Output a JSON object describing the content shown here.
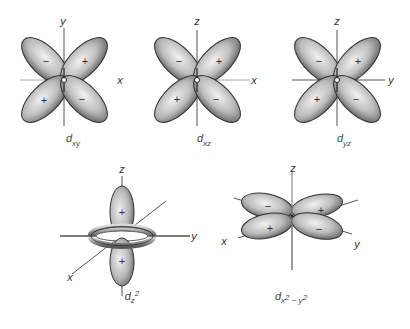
{
  "figure": {
    "colors": {
      "lobe_light": "#e8e8e8",
      "lobe_dark": "#6e6e6e",
      "outline": "#333333",
      "axis": "#555555"
    },
    "orbitals": [
      {
        "id": "dxy",
        "caption_main": "d",
        "caption_sub": "xy",
        "axes": [
          "y",
          "x"
        ],
        "lobe_signs": [
          "−",
          "+",
          "+",
          "−"
        ]
      },
      {
        "id": "dxz",
        "caption_main": "d",
        "caption_sub": "xz",
        "axes": [
          "z",
          "x"
        ],
        "lobe_signs": [
          "−",
          "+",
          "+",
          "−"
        ]
      },
      {
        "id": "dyz",
        "caption_main": "d",
        "caption_sub": "yz",
        "axes": [
          "z",
          "y"
        ],
        "lobe_signs": [
          "−",
          "+",
          "+",
          "−"
        ]
      },
      {
        "id": "dz2",
        "caption_main": "d",
        "caption_sub": "z",
        "caption_sup": "2",
        "axes": [
          "z",
          "y",
          "x"
        ],
        "lobe_signs": [
          "+",
          "+"
        ]
      },
      {
        "id": "dx2y2",
        "caption_main": "d",
        "caption_sub": "x",
        "caption_sup": "2",
        "caption_sub2": " − y",
        "caption_sup2": "2",
        "axes": [
          "z",
          "x",
          "y"
        ],
        "lobe_signs": [
          "−",
          "+",
          "+",
          "−"
        ]
      }
    ]
  }
}
